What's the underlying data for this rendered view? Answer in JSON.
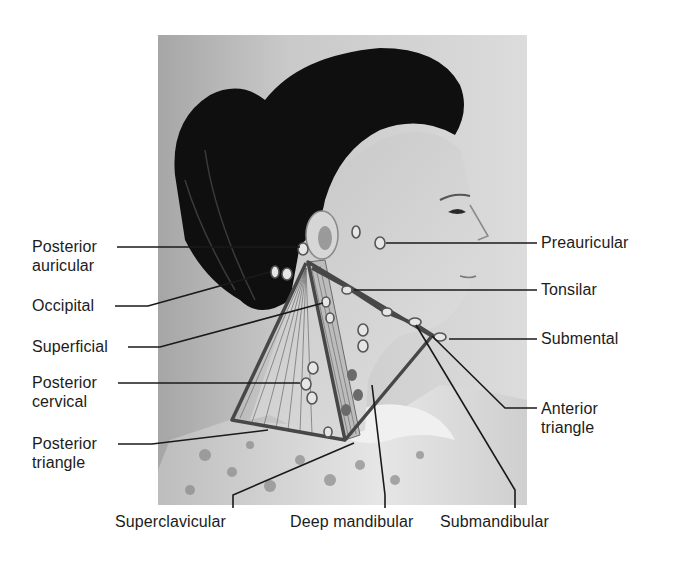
{
  "figure": {
    "colors": {
      "background": "#ffffff",
      "photo_bg_light": "#d8d8d8",
      "photo_bg_dark": "#9a9a9a",
      "hair": "#0d0d0d",
      "skin": "#cfcfcf",
      "node_fill": "#e4e4e4",
      "node_stroke": "#5a5a5a",
      "triangle_line": "#4a4a4a",
      "leader_line": "#1a1a1a",
      "label_text": "#1c1c1c"
    }
  },
  "labels_left": [
    {
      "id": "posterior-auricular",
      "lines": [
        "Posterior",
        "auricular"
      ]
    },
    {
      "id": "occipital",
      "lines": [
        "Occipital"
      ]
    },
    {
      "id": "superficial",
      "lines": [
        "Superficial"
      ]
    },
    {
      "id": "posterior-cervical",
      "lines": [
        "Posterior",
        "cervical"
      ]
    },
    {
      "id": "posterior-triangle",
      "lines": [
        "Posterior",
        "triangle"
      ]
    }
  ],
  "labels_right": [
    {
      "id": "preauricular",
      "lines": [
        "Preauricular"
      ]
    },
    {
      "id": "tonsilar",
      "lines": [
        "Tonsilar"
      ]
    },
    {
      "id": "submental",
      "lines": [
        "Submental"
      ]
    },
    {
      "id": "anterior-triangle",
      "lines": [
        "Anterior",
        "triangle"
      ]
    }
  ],
  "labels_bottom": [
    {
      "id": "superclavicular",
      "lines": [
        "Superclavicular"
      ]
    },
    {
      "id": "deep-mandibular",
      "lines": [
        "Deep mandibular"
      ]
    },
    {
      "id": "submandibular",
      "lines": [
        "Submandibular"
      ]
    }
  ]
}
